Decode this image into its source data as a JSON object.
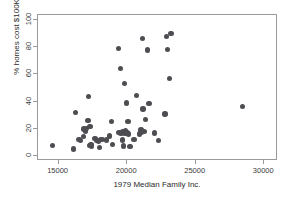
{
  "chart_data": {
    "type": "scatter",
    "title": "",
    "xlabel": "1979 Median Family Inc.",
    "ylabel": "% homes cost $100K+",
    "xlim": [
      13500,
      31000
    ],
    "ylim": [
      -4,
      104
    ],
    "xticks": [
      15000,
      20000,
      25000,
      30000
    ],
    "yticks": [
      0,
      20,
      40,
      60,
      80,
      100
    ],
    "xtick_labels": [
      "15000",
      "20000",
      "25000",
      "30000"
    ],
    "ytick_labels": [
      "0",
      "20",
      "40",
      "60",
      "80",
      "100"
    ],
    "grid": false,
    "legend": "none",
    "marker": {
      "shape": "circle",
      "color": "#4d4d52",
      "size": 5
    },
    "series": [
      {
        "name": "cities",
        "points": [
          [
            14550,
            7.5
          ],
          [
            16100,
            4.8
          ],
          [
            16250,
            31.8
          ],
          [
            16500,
            12.0
          ],
          [
            16600,
            11.2
          ],
          [
            16800,
            14.0
          ],
          [
            16850,
            19.6
          ],
          [
            16950,
            18.3
          ],
          [
            17050,
            20.0
          ],
          [
            17150,
            25.8
          ],
          [
            17200,
            43.8
          ],
          [
            17250,
            7.4
          ],
          [
            17300,
            21.6
          ],
          [
            17350,
            8.4
          ],
          [
            17400,
            7.2
          ],
          [
            17650,
            12.6
          ],
          [
            17800,
            11.0
          ],
          [
            17900,
            10.4
          ],
          [
            18000,
            6.0
          ],
          [
            18050,
            11.8
          ],
          [
            18200,
            12.0
          ],
          [
            18500,
            11.5
          ],
          [
            18700,
            14.5
          ],
          [
            18850,
            25.0
          ],
          [
            18950,
            8.2
          ],
          [
            19350,
            79.0
          ],
          [
            19400,
            17.0
          ],
          [
            19500,
            64.5
          ],
          [
            19550,
            16.2
          ],
          [
            19650,
            11.5
          ],
          [
            19700,
            17.4
          ],
          [
            19750,
            7.0
          ],
          [
            19800,
            53.5
          ],
          [
            19850,
            16.8
          ],
          [
            19900,
            18.4
          ],
          [
            19950,
            38.8
          ],
          [
            20000,
            17.2
          ],
          [
            20050,
            25.2
          ],
          [
            20100,
            16.0
          ],
          [
            20200,
            6.8
          ],
          [
            20500,
            12.0
          ],
          [
            20700,
            44.5
          ],
          [
            20900,
            16.0
          ],
          [
            21000,
            18.8
          ],
          [
            21050,
            17.2
          ],
          [
            21100,
            86.5
          ],
          [
            21150,
            34.6
          ],
          [
            21250,
            18.0
          ],
          [
            21350,
            26.8
          ],
          [
            21500,
            78.2
          ],
          [
            21600,
            38.4
          ],
          [
            22000,
            16.8
          ],
          [
            22300,
            11.0
          ],
          [
            22750,
            30.8
          ],
          [
            22850,
            88.2
          ],
          [
            22950,
            78.6
          ],
          [
            23100,
            57.0
          ],
          [
            23200,
            90.5
          ],
          [
            28400,
            36.4
          ]
        ]
      }
    ]
  }
}
